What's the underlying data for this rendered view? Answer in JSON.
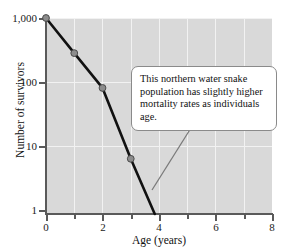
{
  "chart_data": {
    "type": "line",
    "title": "",
    "xlabel": "Age (years)",
    "ylabel": "Number of survivors",
    "xlim": [
      0,
      8
    ],
    "ylim": [
      1,
      1000
    ],
    "yscale": "log",
    "grid": true,
    "legend": null,
    "x_ticks": [
      0,
      1,
      2,
      3,
      4,
      5,
      6,
      7,
      8
    ],
    "x_tick_labels": [
      "0",
      "",
      "2",
      "",
      "4",
      "",
      "6",
      "",
      "8"
    ],
    "y_ticks": [
      1,
      10,
      100,
      1000
    ],
    "y_tick_labels": [
      "1",
      "10",
      "100",
      "1,000"
    ],
    "series": [
      {
        "name": "Northern water snake survivorship",
        "x": [
          0,
          1,
          2,
          3,
          3.85
        ],
        "values": [
          1000,
          290,
          85,
          7,
          1
        ],
        "markers_at": [
          0,
          1,
          2,
          3
        ],
        "marker_color": "#8c8c8c",
        "line_color": "#111111"
      }
    ],
    "annotations": [
      {
        "text": "This northern water snake population has slightly higher mortality rates as individuals age.",
        "lines": [
          "This northern water snake",
          "population has slightly higher",
          "mortality rates as individuals age."
        ],
        "leader_from": [
          152,
          190
        ],
        "leader_to": [
          196,
          120
        ]
      }
    ]
  },
  "axes": {
    "y_labels": [
      {
        "text": "1,000",
        "value": 1000
      },
      {
        "text": "100",
        "value": 100
      },
      {
        "text": "10",
        "value": 10
      },
      {
        "text": "1",
        "value": 1
      }
    ],
    "x_labels": [
      {
        "text": "0",
        "value": 0
      },
      {
        "text": "2",
        "value": 2
      },
      {
        "text": "4",
        "value": 4
      },
      {
        "text": "6",
        "value": 6
      },
      {
        "text": "8",
        "value": 8
      }
    ],
    "y_title": "Number of survivors",
    "x_title": "Age (years)"
  },
  "callout": {
    "line1": "This northern water snake",
    "line2": "population has slightly higher",
    "line3": "mortality rates as individuals age."
  },
  "colors": {
    "panel_background": "#d9d9d9",
    "gridline": "#f2f2f2",
    "axis": "#5a5a5a",
    "data_line": "#111111",
    "marker_fill": "#8c8c8c",
    "marker_edge": "#4a4a4a",
    "callout_border": "#8a8a8a",
    "callout_background": "#ffffff",
    "leader_line": "#7a7a7a"
  }
}
